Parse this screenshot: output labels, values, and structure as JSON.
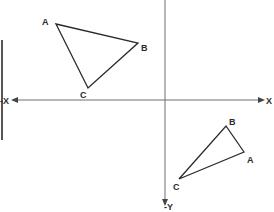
{
  "diagram": {
    "axes": {
      "x_positive_label": "X",
      "x_negative_label": "-X",
      "y_label": "-Y",
      "stroke": "#6e6e6e"
    },
    "left_bar": {
      "stroke": "#555555"
    },
    "triangle_upper": {
      "stroke": "#2a2a2a",
      "vertices": {
        "A": {
          "label": "A",
          "x": 56,
          "y": 24
        },
        "B": {
          "label": "B",
          "x": 138,
          "y": 43
        },
        "C": {
          "label": "C",
          "x": 88,
          "y": 88
        }
      }
    },
    "triangle_lower": {
      "stroke": "#2a2a2a",
      "vertices": {
        "A": {
          "label": "A",
          "x": 244,
          "y": 152
        },
        "B": {
          "label": "B",
          "x": 226,
          "y": 126
        },
        "C": {
          "label": "C",
          "x": 179,
          "y": 179
        }
      }
    }
  }
}
